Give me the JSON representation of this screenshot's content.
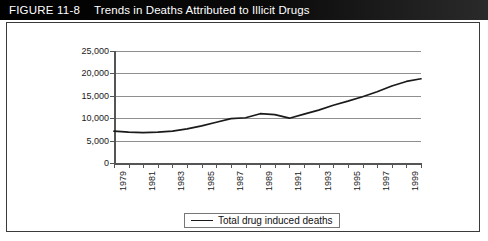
{
  "figure": {
    "label": "FIGURE 11-8",
    "title": "Trends in Deaths Attributed to Illicit Drugs"
  },
  "chart_data": {
    "type": "line",
    "title": "",
    "xlabel": "",
    "ylabel": "",
    "ylim": [
      0,
      25000
    ],
    "ytick_labels": [
      "25,000",
      "20,000",
      "15,000",
      "10,000",
      "5,000",
      "0"
    ],
    "ytick_values": [
      25000,
      20000,
      15000,
      10000,
      5000,
      0
    ],
    "grid": true,
    "legend_position": "bottom-center",
    "x": [
      1979,
      1980,
      1981,
      1982,
      1983,
      1984,
      1985,
      1986,
      1987,
      1988,
      1989,
      1990,
      1991,
      1992,
      1993,
      1994,
      1995,
      1996,
      1997,
      1998,
      1999,
      2000
    ],
    "xtick_labels": [
      "1979",
      "1981",
      "1983",
      "1985",
      "1987",
      "1989",
      "1991",
      "1993",
      "1995",
      "1997",
      "1999"
    ],
    "xtick_values": [
      1979,
      1981,
      1983,
      1985,
      1987,
      1989,
      1991,
      1993,
      1995,
      1997,
      1999
    ],
    "series": [
      {
        "name": "Total drug induced deaths",
        "color": "#1a1a1a",
        "values": [
          7100,
          6900,
          6800,
          6900,
          7100,
          7600,
          8300,
          9100,
          9900,
          10100,
          11000,
          10800,
          10000,
          10900,
          11800,
          12900,
          13800,
          14800,
          15900,
          17200,
          18200,
          18800
        ]
      }
    ]
  },
  "legend": {
    "entries": [
      {
        "label": "Total drug induced deaths"
      }
    ]
  }
}
